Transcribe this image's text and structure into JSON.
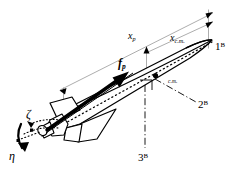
{
  "figure": {
    "background_color": "#ffffff",
    "stroke_color": "#000000",
    "thin_stroke_color": "#808080",
    "labels": {
      "x_p": {
        "symbol": "x",
        "subscript": "p",
        "text": "xp"
      },
      "x_cm": {
        "symbol": "x",
        "subscript": "c.m.",
        "text": "xc.m."
      },
      "force_p": {
        "symbol": "f",
        "subscript": "p",
        "text": "fp"
      },
      "cm_point": {
        "text": "c.m."
      },
      "axis_1B": {
        "symbol": "1",
        "superscript": "B",
        "text": "1B"
      },
      "axis_2B": {
        "symbol": "2",
        "superscript": "B",
        "text": "2B"
      },
      "axis_3B": {
        "symbol": "3",
        "superscript": "B",
        "text": "3B"
      },
      "zeta": {
        "text": "ζ"
      },
      "eta": {
        "text": "η"
      }
    }
  }
}
